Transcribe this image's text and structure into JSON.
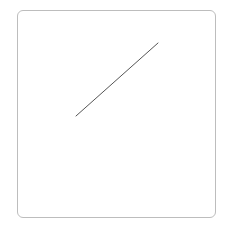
{
  "diagram": {
    "frame": {
      "border_color": "#bdbdbd",
      "corner_radius": 6
    },
    "line": {
      "x1": 76,
      "y1": 116,
      "x2": 158,
      "y2": 43,
      "stroke": "#555555",
      "stroke_width": 1
    }
  }
}
